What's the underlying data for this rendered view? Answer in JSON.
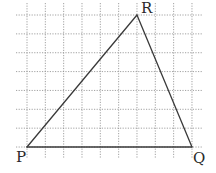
{
  "diagram": {
    "type": "triangle-on-grid",
    "grid": {
      "columns": 10,
      "rows": 8,
      "x_origin": 27,
      "y_origin": 15,
      "x_step": 18.33,
      "y_step": 18.86,
      "x_extent": [
        16,
        203
      ],
      "y_extent": [
        3,
        158
      ],
      "line_color": "#8a8a8a",
      "style": "dotted"
    },
    "vertices": [
      {
        "name": "P",
        "label": "P",
        "col": 0,
        "row": 7,
        "label_dx": -11,
        "label_dy": 15
      },
      {
        "name": "Q",
        "label": "Q",
        "col": 9,
        "row": 7,
        "label_dx": 1,
        "label_dy": 16
      },
      {
        "name": "R",
        "label": "R",
        "col": 6,
        "row": 0,
        "label_dx": 4,
        "label_dy": -2
      }
    ],
    "edges": [
      [
        "P",
        "Q"
      ],
      [
        "Q",
        "R"
      ],
      [
        "R",
        "P"
      ]
    ],
    "edge_color": "#3a3a3a",
    "label_color": "#2a2a2a"
  }
}
